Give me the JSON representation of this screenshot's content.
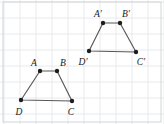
{
  "figure": {
    "canvas": {
      "width": 164,
      "height": 124
    },
    "grid": {
      "spacing": 16,
      "origin_x": 4,
      "origin_y": 2,
      "color": "#e2e4e6",
      "visible": true
    },
    "frame": {
      "color": "#d2d4d6",
      "x": 3,
      "y": 2,
      "width": 158,
      "height": 120
    },
    "style": {
      "edge_color": "#58585a",
      "vertex_color": "#1d1d1f",
      "label_color": "#18181a",
      "vertex_radius": 2.2
    },
    "shapes": [
      {
        "id": "preimage",
        "name": "trapezoid-abcd",
        "closed": true,
        "vertices": [
          {
            "label": "A",
            "x": 40,
            "y": 71,
            "label_x": 34,
            "label_y": 66,
            "label_anchor": "middle"
          },
          {
            "label": "B",
            "x": 57,
            "y": 71,
            "label_x": 63,
            "label_y": 66,
            "label_anchor": "middle"
          },
          {
            "label": "C",
            "x": 72,
            "y": 101,
            "label_x": 71,
            "label_y": 115,
            "label_anchor": "middle"
          },
          {
            "label": "D",
            "x": 21,
            "y": 100,
            "label_x": 19,
            "label_y": 115,
            "label_anchor": "middle"
          }
        ]
      },
      {
        "id": "image",
        "name": "trapezoid-a-prime-b-prime-c-prime-d-prime",
        "closed": true,
        "vertices": [
          {
            "label": "A′",
            "x": 103,
            "y": 23,
            "label_x": 98,
            "label_y": 17,
            "label_anchor": "middle"
          },
          {
            "label": "B′",
            "x": 120,
            "y": 23,
            "label_x": 126,
            "label_y": 17,
            "label_anchor": "middle"
          },
          {
            "label": "C′",
            "x": 136,
            "y": 52,
            "label_x": 141,
            "label_y": 65,
            "label_anchor": "middle"
          },
          {
            "label": "D′",
            "x": 89,
            "y": 51,
            "label_x": 83,
            "label_y": 65,
            "label_anchor": "middle"
          }
        ]
      }
    ]
  }
}
